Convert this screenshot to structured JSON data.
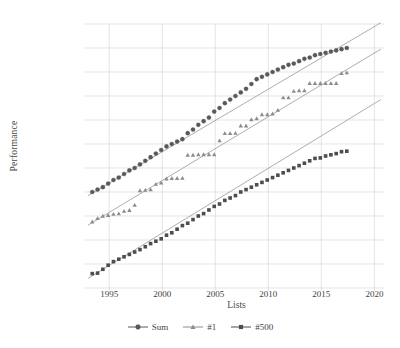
{
  "chart_data": {
    "type": "scatter",
    "title": "",
    "xlabel": "Lists",
    "ylabel": "Performance",
    "grid": true,
    "legend_position": "bottom",
    "xlim": [
      1993,
      2021
    ],
    "xticks": [
      "1995",
      "2000",
      "2005",
      "2010",
      "2015",
      "2020"
    ],
    "xtick_values": [
      1995,
      2000,
      2005,
      2010,
      2015,
      2020
    ],
    "ylim_log10_flops": [
      8,
      19
    ],
    "yticks": [
      "10 EFlop/s",
      "1 EFlop/s",
      "100 PFlop/s",
      "10 PFlop/s",
      "1 PFlop/s",
      "100 TFlop/s",
      "10 TFlop/s",
      "1 TFlop/s",
      "100 GFlop/s",
      "10 GFlop/s",
      "1 GFlop/s",
      "100 MFlop/s"
    ],
    "ytick_log10_flops": [
      19,
      18,
      17,
      16,
      15,
      14,
      13,
      12,
      11,
      10,
      9,
      8
    ],
    "series": [
      {
        "name": "Sum",
        "marker": "circle",
        "color": "#595959",
        "trendline": true,
        "x": [
          1993.4,
          1993.9,
          1994.4,
          1994.9,
          1995.4,
          1995.9,
          1996.4,
          1996.9,
          1997.4,
          1997.9,
          1998.4,
          1998.9,
          1999.4,
          1999.9,
          2000.4,
          2000.9,
          2001.4,
          2001.9,
          2002.4,
          2002.9,
          2003.4,
          2003.9,
          2004.4,
          2004.9,
          2005.4,
          2005.9,
          2006.4,
          2006.9,
          2007.4,
          2007.9,
          2008.4,
          2008.9,
          2009.4,
          2009.9,
          2010.4,
          2010.9,
          2011.4,
          2011.9,
          2012.4,
          2012.9,
          2013.4,
          2013.9,
          2014.4,
          2014.9,
          2015.4,
          2015.9,
          2016.4,
          2016.9,
          2017.4
        ],
        "y_log10_flops": [
          12.0,
          12.1,
          12.2,
          12.35,
          12.5,
          12.6,
          12.75,
          12.9,
          13.0,
          13.15,
          13.3,
          13.45,
          13.6,
          13.75,
          13.9,
          14.0,
          14.1,
          14.2,
          14.45,
          14.6,
          14.8,
          14.95,
          15.1,
          15.35,
          15.5,
          15.7,
          15.85,
          16.0,
          16.15,
          16.3,
          16.5,
          16.7,
          16.8,
          16.9,
          17.0,
          17.1,
          17.2,
          17.3,
          17.35,
          17.45,
          17.55,
          17.6,
          17.7,
          17.75,
          17.8,
          17.85,
          17.9,
          17.95,
          18.0
        ]
      },
      {
        "name": "#1",
        "marker": "triangle",
        "color": "#8c8c8c",
        "trendline": true,
        "x": [
          1993.4,
          1993.9,
          1994.4,
          1994.9,
          1995.4,
          1995.9,
          1996.4,
          1996.9,
          1997.4,
          1997.9,
          1998.4,
          1998.9,
          1999.4,
          1999.9,
          2000.4,
          2000.9,
          2001.4,
          2001.9,
          2002.4,
          2002.9,
          2003.4,
          2003.9,
          2004.4,
          2004.9,
          2005.4,
          2005.9,
          2006.4,
          2006.9,
          2007.4,
          2007.9,
          2008.4,
          2008.9,
          2009.4,
          2009.9,
          2010.4,
          2010.9,
          2011.4,
          2011.9,
          2012.4,
          2012.9,
          2013.4,
          2013.9,
          2014.4,
          2014.9,
          2015.4,
          2015.9,
          2016.4,
          2016.9,
          2017.4
        ],
        "y_log10_flops": [
          10.76,
          10.9,
          11.0,
          11.03,
          11.08,
          11.1,
          11.2,
          11.24,
          11.45,
          12.06,
          12.08,
          12.1,
          12.33,
          12.38,
          12.55,
          12.57,
          12.57,
          12.58,
          13.54,
          13.54,
          13.56,
          13.56,
          13.56,
          13.56,
          14.14,
          14.44,
          14.44,
          14.45,
          14.76,
          14.76,
          15.02,
          15.06,
          15.23,
          15.23,
          15.26,
          15.41,
          15.93,
          15.93,
          16.2,
          16.23,
          16.23,
          16.53,
          16.53,
          16.53,
          16.53,
          16.53,
          16.53,
          16.94,
          16.97
        ]
      },
      {
        "name": "#500",
        "marker": "square",
        "color": "#4d4d4d",
        "trendline": true,
        "x": [
          1993.4,
          1993.9,
          1994.4,
          1994.9,
          1995.4,
          1995.9,
          1996.4,
          1996.9,
          1997.4,
          1997.9,
          1998.4,
          1998.9,
          1999.4,
          1999.9,
          2000.4,
          2000.9,
          2001.4,
          2001.9,
          2002.4,
          2002.9,
          2003.4,
          2003.9,
          2004.4,
          2004.9,
          2005.4,
          2005.9,
          2006.4,
          2006.9,
          2007.4,
          2007.9,
          2008.4,
          2008.9,
          2009.4,
          2009.9,
          2010.4,
          2010.9,
          2011.4,
          2011.9,
          2012.4,
          2012.9,
          2013.4,
          2013.9,
          2014.4,
          2014.9,
          2015.4,
          2015.9,
          2016.4,
          2016.9,
          2017.4
        ],
        "y_log10_flops": [
          8.6,
          8.62,
          8.78,
          8.95,
          9.1,
          9.2,
          9.3,
          9.4,
          9.5,
          9.6,
          9.72,
          9.85,
          9.95,
          10.05,
          10.2,
          10.3,
          10.45,
          10.6,
          10.7,
          10.85,
          11.0,
          11.1,
          11.25,
          11.4,
          11.5,
          11.65,
          11.75,
          11.85,
          12.0,
          12.1,
          12.2,
          12.3,
          12.4,
          12.5,
          12.6,
          12.7,
          12.8,
          12.9,
          13.0,
          13.1,
          13.2,
          13.3,
          13.4,
          13.42,
          13.5,
          13.55,
          13.6,
          13.68,
          13.7
        ]
      }
    ],
    "trendlines": [
      {
        "name": "Sum-trend",
        "x0": 1993.0,
        "y0_log10": 11.85,
        "x1": 2020.6,
        "y1_log10": 19.05
      },
      {
        "name": "#1-trend",
        "x0": 1993.0,
        "y0_log10": 10.62,
        "x1": 2020.6,
        "y1_log10": 17.95
      },
      {
        "name": "#500-trend",
        "x0": 1993.0,
        "y0_log10": 8.4,
        "x1": 2020.6,
        "y1_log10": 15.85
      }
    ]
  },
  "axes": {
    "ylabel": "Performance",
    "xlabel": "Lists",
    "ytick_labels": [
      "10 EFlop/s",
      "1 EFlop/s",
      "100 PFlop/s",
      "10 PFlop/s",
      "1 PFlop/s",
      "100 TFlop/s",
      "10 TFlop/s",
      "1 TFlop/s",
      "100 GFlop/s",
      "10 GFlop/s",
      "1 GFlop/s",
      "100 MFlop/s"
    ],
    "xtick_labels": [
      "1995",
      "2000",
      "2005",
      "2010",
      "2015",
      "2020"
    ]
  },
  "legend": {
    "items": [
      {
        "label": "Sum",
        "marker": "circle",
        "color": "#595959"
      },
      {
        "label": "#1",
        "marker": "triangle",
        "color": "#8c8c8c"
      },
      {
        "label": "#500",
        "marker": "square",
        "color": "#4d4d4d"
      }
    ]
  },
  "colors": {
    "grid": "#d9d9d9",
    "text": "#3f3f3f",
    "background": "#ffffff"
  }
}
